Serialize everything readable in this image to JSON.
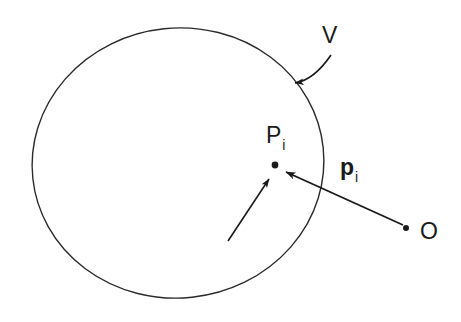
{
  "figure": {
    "kind": "geometry-diagram",
    "background_color": "#ffffff",
    "stroke_color": "#1a1a1a",
    "labels": {
      "volume": {
        "base": "V",
        "sub": ""
      },
      "point": {
        "base": "P",
        "sub": "i"
      },
      "vector": {
        "base": "p",
        "sub": "i"
      },
      "origin": {
        "base": "O",
        "sub": ""
      }
    },
    "geometry": {
      "region_boundary": {
        "shape": "closed-curve-circle",
        "center_x": 178,
        "center_y": 163,
        "radius_x": 146,
        "radius_y": 135
      },
      "point_marker": {
        "x": 275,
        "y": 165,
        "radius": 3.4
      },
      "origin_marker": {
        "x": 406,
        "y": 228,
        "radius": 3.0
      },
      "position_vector": {
        "from_x": 403,
        "from_y": 225,
        "to_x": 283,
        "to_y": 171
      },
      "pointer_arrow": {
        "from_x": 228,
        "from_y": 241,
        "to_x": 267,
        "to_y": 177
      },
      "leader_curve": {
        "start_x": 331,
        "start_y": 55,
        "ctrl_x": 316,
        "ctrl_y": 79,
        "end_x": 293,
        "end_y": 83
      }
    }
  }
}
